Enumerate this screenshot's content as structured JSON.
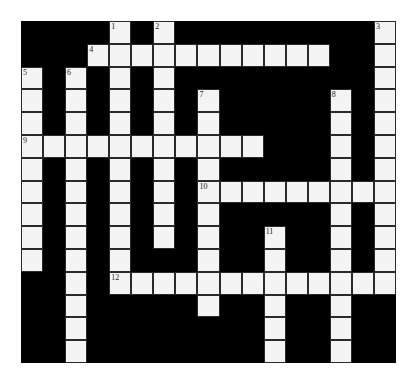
{
  "puzzle": {
    "cols": 17,
    "rows": 15,
    "white_cells": {
      "0": [
        4,
        6,
        16
      ],
      "1": [
        3,
        4,
        5,
        6,
        7,
        8,
        9,
        10,
        11,
        12,
        13,
        16
      ],
      "2": [
        0,
        2,
        4,
        6,
        16
      ],
      "3": [
        0,
        2,
        4,
        6,
        8,
        14,
        16
      ],
      "4": [
        0,
        2,
        4,
        6,
        8,
        14,
        16
      ],
      "5": [
        0,
        1,
        2,
        3,
        4,
        5,
        6,
        7,
        8,
        9,
        10,
        14,
        16
      ],
      "6": [
        0,
        2,
        4,
        6,
        8,
        14,
        16
      ],
      "7": [
        0,
        2,
        4,
        6,
        8,
        9,
        10,
        11,
        12,
        13,
        14,
        15,
        16
      ],
      "8": [
        0,
        2,
        4,
        6,
        8,
        14,
        16
      ],
      "9": [
        0,
        2,
        4,
        6,
        8,
        11,
        14,
        16
      ],
      "10": [
        0,
        2,
        4,
        8,
        11,
        14,
        16
      ],
      "11": [
        2,
        4,
        5,
        6,
        7,
        8,
        9,
        10,
        11,
        12,
        13,
        14,
        15,
        16
      ],
      "12": [
        2,
        8,
        11,
        14
      ],
      "13": [
        2,
        11,
        14
      ],
      "14": [
        2,
        11,
        14
      ]
    },
    "numbers": [
      {
        "label": "1",
        "row": 0,
        "col": 4
      },
      {
        "label": "2",
        "row": 0,
        "col": 6
      },
      {
        "label": "3",
        "row": 0,
        "col": 16
      },
      {
        "label": "4",
        "row": 1,
        "col": 3
      },
      {
        "label": "5",
        "row": 2,
        "col": 0
      },
      {
        "label": "6",
        "row": 2,
        "col": 2
      },
      {
        "label": "7",
        "row": 3,
        "col": 8
      },
      {
        "label": "8",
        "row": 3,
        "col": 14
      },
      {
        "label": "9",
        "row": 5,
        "col": 0
      },
      {
        "label": "10",
        "row": 7,
        "col": 8
      },
      {
        "label": "11",
        "row": 9,
        "col": 11
      },
      {
        "label": "12",
        "row": 11,
        "col": 4
      }
    ],
    "entries": {
      "across": [
        {
          "number": "4",
          "row": 1,
          "col": 3,
          "length": 11
        },
        {
          "number": "9",
          "row": 5,
          "col": 0,
          "length": 11
        },
        {
          "number": "10",
          "row": 7,
          "col": 8,
          "length": 9
        },
        {
          "number": "12",
          "row": 11,
          "col": 4,
          "length": 13
        }
      ],
      "down": [
        {
          "number": "1",
          "row": 0,
          "col": 4,
          "length": 12
        },
        {
          "number": "2",
          "row": 0,
          "col": 6,
          "length": 10
        },
        {
          "number": "3",
          "row": 0,
          "col": 16,
          "length": 12
        },
        {
          "number": "5",
          "row": 2,
          "col": 0,
          "length": 9
        },
        {
          "number": "6",
          "row": 2,
          "col": 2,
          "length": 13
        },
        {
          "number": "7",
          "row": 3,
          "col": 8,
          "length": 10
        },
        {
          "number": "8",
          "row": 3,
          "col": 14,
          "length": 12
        },
        {
          "number": "11",
          "row": 9,
          "col": 11,
          "length": 6
        }
      ]
    },
    "colors": {
      "block": "#000000",
      "cell": "#f4f4f4",
      "border": "#2a2a2a"
    }
  }
}
